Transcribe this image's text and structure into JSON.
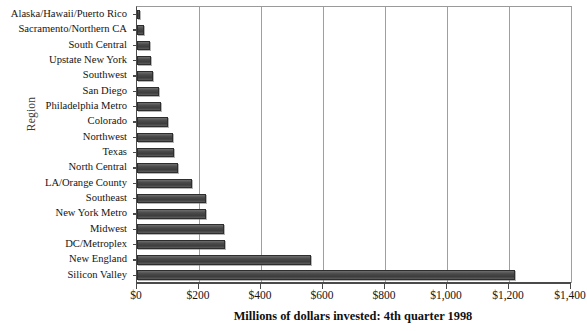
{
  "chart_data": {
    "type": "bar",
    "orientation": "horizontal",
    "title": "",
    "xlabel": "Millions of dollars invested: 4th quarter 1998",
    "ylabel": "Region",
    "xlim": [
      0,
      1400
    ],
    "xticks": [
      0,
      200,
      400,
      600,
      800,
      1000,
      1200,
      1400
    ],
    "xtick_labels": [
      "$0",
      "$200",
      "$400",
      "$600",
      "$800",
      "$1,000",
      "$1,200",
      "$1,400"
    ],
    "grid": true,
    "grid_axis": "x",
    "legend": "none",
    "bar_color": "#4a4a4a",
    "categories": [
      "Alaska/Hawaii/Puerto Rico",
      "Sacramento/Northern CA",
      "South Central",
      "Upstate New York",
      "Southwest",
      "San Diego",
      "Philadelphia Metro",
      "Colorado",
      "Northwest",
      "Texas",
      "North Central",
      "LA/Orange County",
      "Southeast",
      "New York Metro",
      "Midwest",
      "DC/Metroplex",
      "New England",
      "Silicon Valley"
    ],
    "values": [
      10,
      22,
      42,
      46,
      52,
      70,
      76,
      100,
      116,
      120,
      132,
      176,
      222,
      224,
      280,
      284,
      560,
      1220
    ]
  },
  "axes": {
    "y_title": "Region",
    "x_title": "Millions of dollars invested: 4th quarter 1998"
  }
}
